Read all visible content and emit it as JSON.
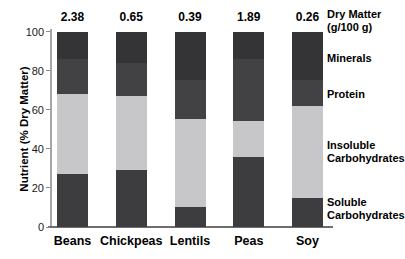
{
  "chart_data": {
    "type": "bar",
    "stacked": true,
    "categories": [
      "Beans",
      "Chickpeas",
      "Lentils",
      "Peas",
      "Soy"
    ],
    "dry_matter_values": [
      "2.38",
      "0.65",
      "0.39",
      "1.89",
      "0.26"
    ],
    "series": [
      {
        "name": "Soluble Carbohydrates",
        "values": [
          27,
          29,
          10,
          36,
          15
        ],
        "color": "#3d3d3f"
      },
      {
        "name": "Insoluble Carbohydrates",
        "values": [
          41,
          38,
          45,
          18,
          47
        ],
        "color": "#c7c7c9"
      },
      {
        "name": "Protein",
        "values": [
          18,
          17,
          20,
          32,
          13
        ],
        "color": "#424245"
      },
      {
        "name": "Minerals",
        "values": [
          14,
          16,
          25,
          14,
          25
        ],
        "color": "#343437"
      }
    ],
    "ylabel": "Nutrient (% Dry Matter)",
    "xlabel": "",
    "ylim": [
      0,
      100
    ],
    "yticks": [
      0,
      20,
      40,
      60,
      80,
      100
    ],
    "grid": false,
    "legend_position": "right"
  },
  "labels": {
    "y_title": "Nutrient (% Dry Matter)",
    "dry_matter_line1": "Dry Matter",
    "dry_matter_line2": "(g/100 g)",
    "minerals": "Minerals",
    "protein": "Protein",
    "insoluble_line1": "Insoluble",
    "insoluble_line2": "Carbohydrates",
    "soluble_line1": "Soluble",
    "soluble_line2": "Carbohydrates"
  }
}
